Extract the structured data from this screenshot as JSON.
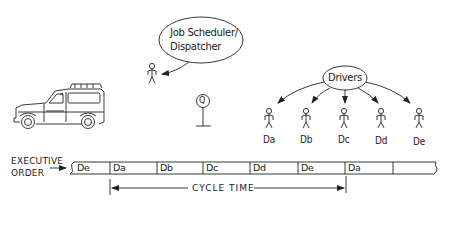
{
  "dispatcher": {
    "bubble_line1": "Job Scheduler/",
    "bubble_line2": "Dispatcher"
  },
  "queue": {
    "label": "Q"
  },
  "drivers": {
    "bubble": "Drivers",
    "members": [
      {
        "label": "Da"
      },
      {
        "label": "Db"
      },
      {
        "label": "Dc"
      },
      {
        "label": "Dd"
      },
      {
        "label": "De"
      }
    ]
  },
  "executive_order": {
    "label_line1": "EXECUTIVE",
    "label_line2": "ORDER",
    "cells": [
      {
        "label": "De"
      },
      {
        "label": "Da"
      },
      {
        "label": "Db"
      },
      {
        "label": "Dc"
      },
      {
        "label": "Dd"
      },
      {
        "label": "De"
      },
      {
        "label": "Da"
      },
      {
        "label": ""
      }
    ]
  },
  "cycle_time": {
    "label": "CYCLE TIME"
  },
  "colors": {
    "ink": "#222222",
    "background": "#ffffff"
  }
}
